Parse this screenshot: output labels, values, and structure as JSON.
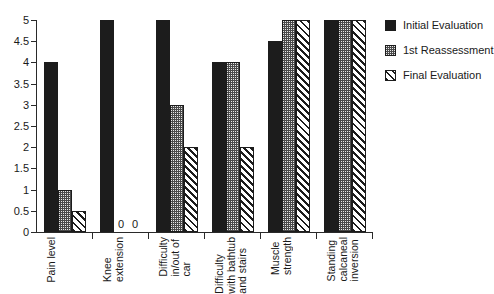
{
  "chart_data": {
    "type": "bar",
    "title": "",
    "subtitle": "",
    "xlabel": "",
    "ylabel": "",
    "ylim": [
      0,
      5
    ],
    "ytick_step": 0.5,
    "yticks": [
      "0",
      "0.5",
      "1",
      "1.5",
      "2",
      "2.5",
      "3",
      "3.5",
      "4",
      "4.5",
      "5"
    ],
    "grid": false,
    "legend_position": "right",
    "categories": [
      "Pain level",
      "Knee\nextension",
      "Difficulty\nin/out of\ncar",
      "Difficulty\nwith bathtub\nand stairs",
      "Muscle\nstrength",
      "Standing\ncalcaneal\ninversion"
    ],
    "series": [
      {
        "name": "Initial Evaluation",
        "pattern": "solid-black",
        "color": "#1c1c1c",
        "values": [
          4,
          5,
          5,
          4,
          4.5,
          5
        ]
      },
      {
        "name": "1st Reassessment",
        "pattern": "dotted-gray",
        "color": "#4a4a4a",
        "values": [
          1,
          0,
          3,
          4,
          5,
          5
        ]
      },
      {
        "name": "Final Evaluation",
        "pattern": "diagonal-hatch",
        "color": "#ffffff",
        "values": [
          0.5,
          0,
          2,
          2,
          5,
          5
        ]
      }
    ],
    "annotations": [
      {
        "text": "0",
        "category_index": 1,
        "series_index": 1
      },
      {
        "text": "0",
        "category_index": 1,
        "series_index": 2
      }
    ]
  },
  "legend": {
    "entries": [
      {
        "label": "Initial Evaluation"
      },
      {
        "label": "1st Reassessment"
      },
      {
        "label": "Final Evaluation"
      }
    ]
  }
}
